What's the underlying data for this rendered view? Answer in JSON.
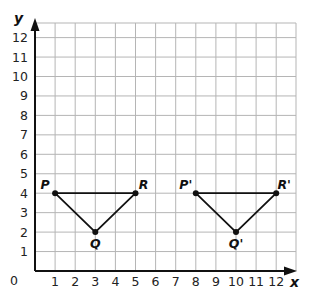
{
  "diagram": {
    "type": "coordinate-plane-translation",
    "axes": {
      "x_label": "x",
      "y_label": "y",
      "origin_label": "0",
      "x_ticks": [
        "1",
        "2",
        "3",
        "4",
        "5",
        "6",
        "7",
        "8",
        "9",
        "10",
        "11",
        "12"
      ],
      "y_ticks": [
        "1",
        "2",
        "3",
        "4",
        "5",
        "6",
        "7",
        "8",
        "9",
        "10",
        "11",
        "12"
      ],
      "x_range": [
        0,
        13
      ],
      "y_range": [
        0,
        12.6
      ],
      "grid": true
    },
    "figures": [
      {
        "name": "triangle-PQR",
        "points": [
          {
            "label": "P",
            "x": 1,
            "y": 4
          },
          {
            "label": "Q",
            "x": 3,
            "y": 2
          },
          {
            "label": "R",
            "x": 5,
            "y": 4
          }
        ]
      },
      {
        "name": "triangle-P'Q'R'",
        "points": [
          {
            "label": "P'",
            "x": 8,
            "y": 4
          },
          {
            "label": "Q'",
            "x": 10,
            "y": 2
          },
          {
            "label": "R'",
            "x": 12,
            "y": 4
          }
        ]
      }
    ],
    "colors": {
      "grid": "#b5b5b5",
      "axis": "#111111",
      "figure": "#111111"
    }
  }
}
